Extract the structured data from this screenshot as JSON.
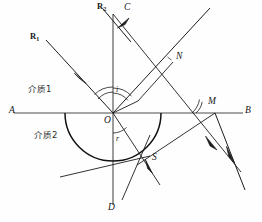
{
  "figure": {
    "stroke_color": "#1c1c1c",
    "axis_color": "#4a4a4a",
    "background": "#fefefe"
  },
  "media": {
    "upper_label": "介质1",
    "lower_label": "介质2"
  },
  "points": {
    "A": "A",
    "B": "B",
    "C": "C",
    "D": "D",
    "O": "O",
    "N": "N",
    "M": "M",
    "S": "S"
  },
  "rays": {
    "r1_label": "R",
    "r1_sub": "1",
    "r2_label": "R",
    "r2_sub": "2"
  },
  "angles": {
    "incidence": "i",
    "refraction": "r"
  },
  "geometry": {
    "interface_y": 113,
    "origin_x": 113,
    "origin_y": 113,
    "normal_top_y": 14,
    "normal_bottom_y": 205,
    "interface_x_start": 14,
    "interface_x_end": 243,
    "semicircle_radius": 48,
    "point_N_x": 173,
    "point_N_y": 62,
    "point_M_x": 215,
    "point_M_y": 113,
    "point_S_x": 150,
    "point_S_y": 156
  }
}
